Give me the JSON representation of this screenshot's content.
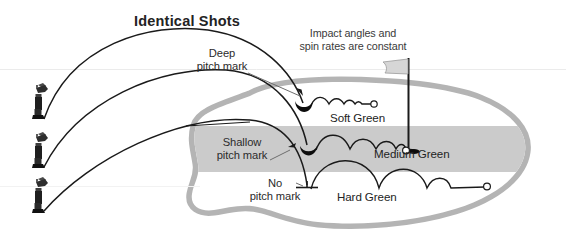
{
  "figure": {
    "title": "Identical Shots",
    "note": [
      "Impact angles and",
      "spin rates are constant"
    ],
    "callouts": [
      {
        "name": "deep-pitch-mark",
        "lines": [
          "Deep",
          "pitch mark"
        ]
      },
      {
        "name": "shallow-pitch-mark",
        "lines": [
          "Shallow",
          "pitch mark"
        ]
      },
      {
        "name": "no-pitch-mark",
        "lines": [
          "No",
          "pitch mark"
        ]
      }
    ],
    "green_labels": [
      {
        "name": "soft-green",
        "text": "Soft Green"
      },
      {
        "name": "medium-green",
        "text": "Medium Green"
      },
      {
        "name": "hard-green",
        "text": "Hard Green"
      }
    ],
    "colors": {
      "green_outline": "#b4b4b4",
      "green_band": "#cbcbcb",
      "green_fill": "#ffffff",
      "ink": "#1a1a1a",
      "text": "#2b2b2b",
      "flag_gray": "#d2d2d2",
      "background": "#ffffff"
    },
    "elements": {
      "golfer_count": 3,
      "trajectory_count": 3,
      "flag": "flagstick",
      "hole": "cup"
    }
  }
}
